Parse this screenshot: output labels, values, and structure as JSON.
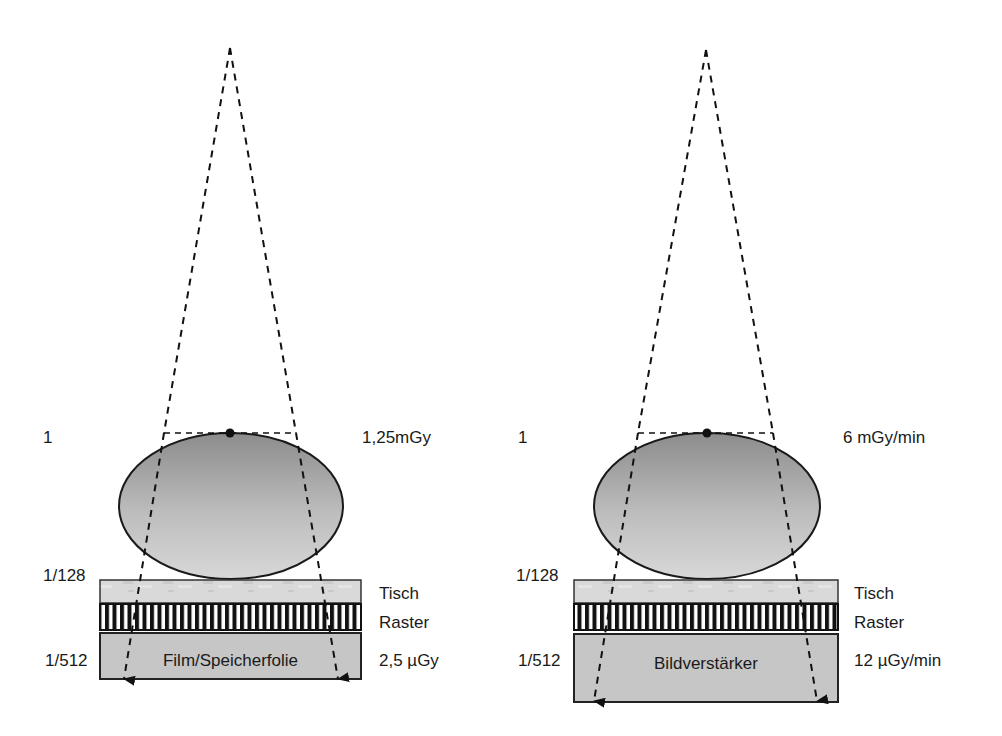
{
  "panels": [
    {
      "id": "radiography",
      "entrance_ratio": "1",
      "entrance_dose": "1,25mGy",
      "table_ratio": "1/128",
      "detector_ratio": "1/512",
      "table_label": "Tisch",
      "grid_label": "Raster",
      "detector_label": "Film/Speicherfolie",
      "detector_dose": "2,5 µGy"
    },
    {
      "id": "fluoroscopy",
      "entrance_ratio": "1",
      "entrance_dose": "6 mGy/min",
      "table_ratio": "1/128",
      "detector_ratio": "1/512",
      "table_label": "Tisch",
      "grid_label": "Raster",
      "detector_label": "Bildverstärker",
      "detector_dose": "12 µGy/min"
    }
  ],
  "colors": {
    "body_top": "#8f8f8f",
    "body_bottom": "#d2d2d2",
    "table": "#d6d6d6",
    "detector": "#c4c4c4",
    "line": "#1a1a1a"
  }
}
